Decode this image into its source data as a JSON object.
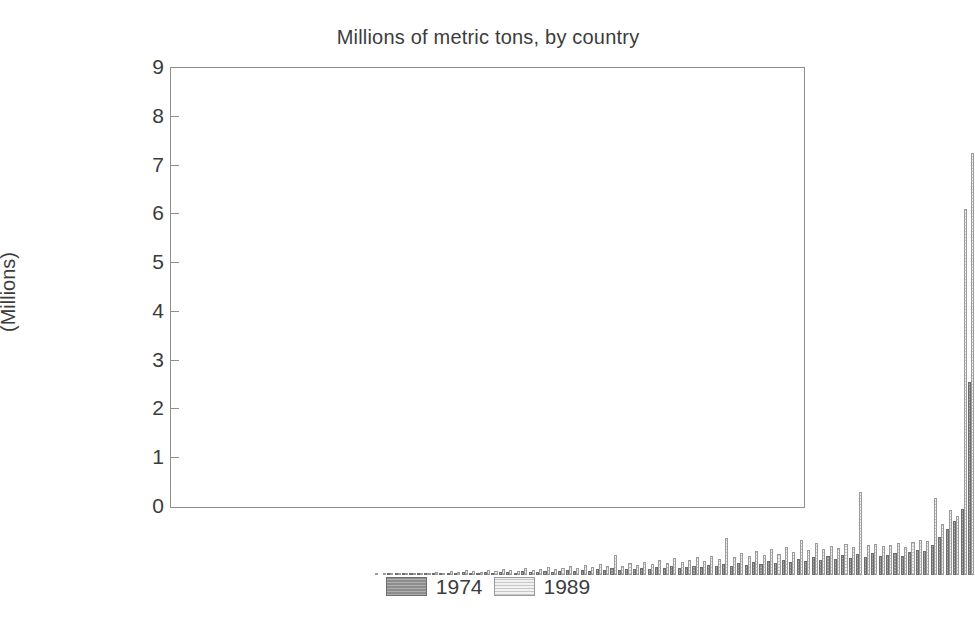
{
  "chart_data": {
    "type": "bar",
    "title": "Millions of metric tons, by country",
    "xlabel": "",
    "ylabel": "(Millions)",
    "ylim": [
      0,
      9
    ],
    "yticks": [
      "0",
      "1",
      "2",
      "3",
      "4",
      "5",
      "6",
      "7",
      "8",
      "9"
    ],
    "grid": false,
    "legend_position": "bottom-center",
    "xtick_labels_shown": false,
    "categories": [
      "C1",
      "C2",
      "C3",
      "C4",
      "C5",
      "C6",
      "C7",
      "C8",
      "C9",
      "C10",
      "C11",
      "C12",
      "C13",
      "C14",
      "C15",
      "C16",
      "C17",
      "C18",
      "C19",
      "C20",
      "C21",
      "C22",
      "C23",
      "C24",
      "C25",
      "C26",
      "C27",
      "C28",
      "C29",
      "C30",
      "C31",
      "C32",
      "C33",
      "C34",
      "C35",
      "C36",
      "C37",
      "C38",
      "C39",
      "C40",
      "C41",
      "C42",
      "C43",
      "C44",
      "C45",
      "C46",
      "C47",
      "C48",
      "C49",
      "C50",
      "C51",
      "C52",
      "C53",
      "C54",
      "C55",
      "C56",
      "C57",
      "C58",
      "C59",
      "C60",
      "C61",
      "C62",
      "C63",
      "C64",
      "C65",
      "C66",
      "C67",
      "C68",
      "C69",
      "C70",
      "C71",
      "C72",
      "C73",
      "C74",
      "C75",
      "C76",
      "C77",
      "C78",
      "C79",
      "C80",
      "C81",
      "C82",
      "C83",
      "C84",
      "C85"
    ],
    "series": [
      {
        "name": "1974",
        "color": "#8d8d8d",
        "values": [
          0.0,
          0.0,
          0.0,
          0.0,
          0.0,
          0.0,
          0.01,
          0.02,
          0.01,
          0.02,
          0.03,
          0.02,
          0.04,
          0.03,
          0.05,
          0.04,
          0.06,
          0.05,
          0.04,
          0.06,
          0.05,
          0.07,
          0.06,
          0.05,
          0.08,
          0.06,
          0.07,
          0.09,
          0.07,
          0.08,
          0.1,
          0.08,
          0.11,
          0.09,
          0.12,
          0.1,
          0.14,
          0.11,
          0.13,
          0.12,
          0.15,
          0.13,
          0.16,
          0.14,
          0.18,
          0.15,
          0.17,
          0.19,
          0.16,
          0.2,
          0.18,
          0.22,
          0.19,
          0.24,
          0.21,
          0.26,
          0.22,
          0.28,
          0.24,
          0.3,
          0.26,
          0.33,
          0.28,
          0.36,
          0.3,
          0.38,
          0.32,
          0.41,
          0.34,
          0.44,
          0.36,
          0.46,
          0.38,
          0.42,
          0.45,
          0.4,
          0.48,
          0.52,
          0.5,
          0.62,
          0.78,
          0.95,
          1.1,
          1.35,
          3.95
        ]
      },
      {
        "name": "1989",
        "color": "#f0f0f0",
        "values": [
          0.0,
          0.0,
          0.0,
          0.0,
          0.01,
          0.01,
          0.02,
          0.03,
          0.02,
          0.04,
          0.05,
          0.04,
          0.07,
          0.05,
          0.09,
          0.07,
          0.1,
          0.08,
          0.07,
          0.11,
          0.09,
          0.12,
          0.1,
          0.09,
          0.14,
          0.11,
          0.13,
          0.16,
          0.12,
          0.15,
          0.18,
          0.14,
          0.2,
          0.16,
          0.22,
          0.18,
          0.41,
          0.19,
          0.24,
          0.21,
          0.27,
          0.22,
          0.3,
          0.25,
          0.34,
          0.27,
          0.31,
          0.36,
          0.29,
          0.38,
          0.33,
          0.75,
          0.36,
          0.45,
          0.39,
          0.5,
          0.41,
          0.53,
          0.44,
          0.57,
          0.47,
          0.72,
          0.51,
          0.66,
          0.54,
          0.6,
          0.56,
          0.63,
          0.58,
          1.7,
          0.61,
          0.64,
          0.59,
          0.62,
          0.66,
          0.57,
          0.68,
          0.72,
          0.7,
          1.57,
          1.05,
          1.33,
          1.2,
          7.5,
          8.65
        ]
      }
    ]
  },
  "legend": {
    "entries": [
      {
        "label": "1974",
        "swatch": "s1974"
      },
      {
        "label": "1989",
        "swatch": "s1989"
      }
    ]
  },
  "axes": {
    "y_title": "(Millions)",
    "y_tick_labels": [
      "9",
      "8",
      "7",
      "6",
      "5",
      "4",
      "3",
      "2",
      "1",
      "0"
    ]
  }
}
